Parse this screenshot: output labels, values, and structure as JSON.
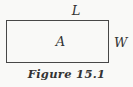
{
  "figure": {
    "top_label": "L",
    "center_label": "A",
    "right_label": "W",
    "caption": "Figure 15.1"
  },
  "colors": {
    "background": "#f9f9f7",
    "line": "#474747",
    "text": "#333333"
  }
}
